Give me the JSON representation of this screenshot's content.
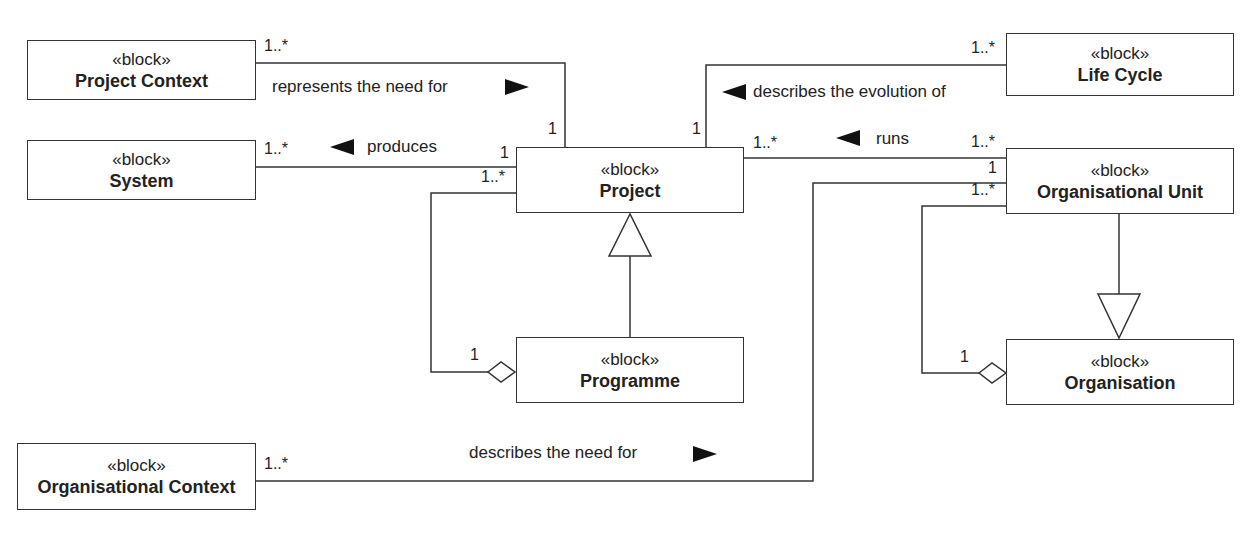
{
  "blocks": {
    "project_context": {
      "stereotype": "«block»",
      "name": "Project Context"
    },
    "system": {
      "stereotype": "«block»",
      "name": "System"
    },
    "project": {
      "stereotype": "«block»",
      "name": "Project"
    },
    "life_cycle": {
      "stereotype": "«block»",
      "name": "Life Cycle"
    },
    "organisational_unit": {
      "stereotype": "«block»",
      "name": "Organisational Unit"
    },
    "programme": {
      "stereotype": "«block»",
      "name": "Programme"
    },
    "organisation": {
      "stereotype": "«block»",
      "name": "Organisation"
    },
    "organisational_context": {
      "stereotype": "«block»",
      "name": "Organisational Context"
    }
  },
  "associations": {
    "represents": {
      "label": "represents the need for",
      "direction": "right",
      "mult_source": "1..*",
      "mult_target": "1"
    },
    "produces": {
      "label": "produces",
      "direction": "left",
      "mult_source": "1..*",
      "mult_target": "1"
    },
    "describes_evolution": {
      "label": "describes the evolution of",
      "direction": "left",
      "mult_source": "1..*",
      "mult_target": "1"
    },
    "runs": {
      "label": "runs",
      "direction": "left",
      "mult_source": "1..*",
      "mult_target": "1..*"
    },
    "describes_need": {
      "label": "describes the need for",
      "direction": "right",
      "mult_source": "1..*",
      "mult_target": "1"
    },
    "programme_aggregation": {
      "mult_part": "1..*",
      "mult_whole": "1"
    },
    "organisation_aggregation": {
      "mult_part": "1..*",
      "mult_whole": "1"
    }
  },
  "generalizations": [
    {
      "child": "Programme",
      "parent": "Project"
    },
    {
      "child": "Organisational Unit",
      "parent": "Organisation"
    }
  ],
  "colors": {
    "line": "#333333",
    "text": "#222222",
    "background": "#ffffff"
  }
}
